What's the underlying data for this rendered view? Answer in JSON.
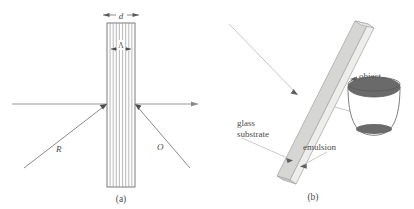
{
  "figure": {
    "panel_a": {
      "caption": "(a)",
      "thickness_label": "d",
      "fringe_spacing_label": "Λ",
      "reference_beam_label": "R",
      "object_beam_label": "O",
      "fringe_count": 8,
      "slab": {
        "x": 107,
        "y": 23,
        "width": 28,
        "height": 164
      },
      "axis_y": 104,
      "colors": {
        "slab_outline": "#6d6d6d",
        "fringe": "#8d8d8d",
        "beam": "#7a7a7a",
        "axis": "#8a8a8a",
        "text": "#4a4a4a"
      }
    },
    "panel_b": {
      "caption": "(b)",
      "labels": {
        "glass_substrate_line1": "glass",
        "glass_substrate_line2": "substrate",
        "emulsion": "emulsion",
        "object": "object"
      },
      "object_shape": "cup",
      "colors": {
        "substrate_face": "#d6d6d4",
        "substrate_edge": "#b4b4b2",
        "emulsion_face": "#ededeb",
        "plate_outline": "#a8a8a6",
        "object_outline": "#6f6f6f",
        "object_rim": "#6a6a6a",
        "leader": "#b0b0ae",
        "beam": "#cfcfcd",
        "text": "#4a4a4a"
      }
    }
  }
}
